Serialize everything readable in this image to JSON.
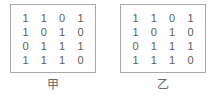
{
  "figure": {
    "background_color": "#ffffff",
    "border_color": "#a9a9a9",
    "digit_color": "#5e5e5e",
    "label_color": "#6a6a6a"
  },
  "panels": [
    {
      "label": "甲",
      "matrix": [
        [
          "1",
          "1",
          "0",
          "1"
        ],
        [
          "1",
          "0",
          "1",
          "0"
        ],
        [
          "0",
          "1",
          "1",
          "1"
        ],
        [
          "1",
          "1",
          "1",
          "0"
        ]
      ]
    },
    {
      "label": "乙",
      "matrix": [
        [
          "1",
          "1",
          "0",
          "1"
        ],
        [
          "1",
          "0",
          "1",
          "0"
        ],
        [
          "0",
          "1",
          "1",
          "1"
        ],
        [
          "1",
          "1",
          "1",
          "0"
        ]
      ]
    }
  ]
}
